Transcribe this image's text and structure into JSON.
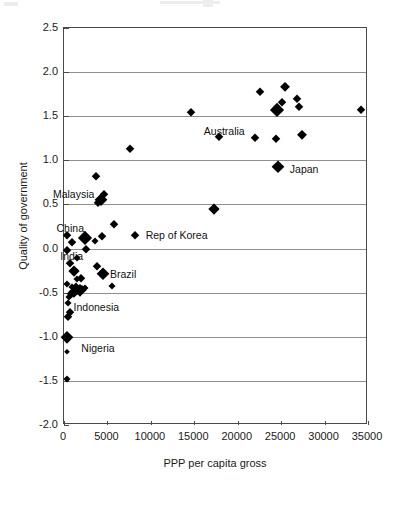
{
  "chart_data": {
    "type": "scatter",
    "title": "",
    "xlabel": "PPP per capita gross",
    "ylabel": "Quality of government",
    "xlim": [
      0,
      35000
    ],
    "ylim": [
      -2.0,
      2.5
    ],
    "xticks": [
      0,
      5000,
      10000,
      15000,
      20000,
      25000,
      30000,
      35000
    ],
    "xtick_labels": [
      "0",
      "5000",
      "10000",
      "15000",
      "20000",
      "25000",
      "30000",
      "35000"
    ],
    "yticks": [
      -2.0,
      -1.5,
      -1.0,
      -0.5,
      0.0,
      0.5,
      1.0,
      1.5,
      2.0,
      2.5
    ],
    "ytick_labels": [
      "-2.0",
      "-1.5",
      "-1.0",
      "-0.5",
      "0.0",
      "0.5",
      "1.0",
      "1.5",
      "2.0",
      "2.5"
    ],
    "grid": "horizontal",
    "legend": "none",
    "marker": "diamond",
    "marker_color": "#000000",
    "note": "Marker size varies with population/weight; larger diamonds denote larger countries.",
    "points": [
      {
        "x": 300,
        "y": -1.48,
        "size": 7
      },
      {
        "x": 350,
        "y": -1.17,
        "size": 6
      },
      {
        "x": 400,
        "y": -1.0,
        "size": 12,
        "label": "Nigeria"
      },
      {
        "x": 500,
        "y": -0.78,
        "size": 9
      },
      {
        "x": 700,
        "y": -0.72,
        "size": 8
      },
      {
        "x": 450,
        "y": -0.62,
        "size": 7
      },
      {
        "x": 600,
        "y": -0.55,
        "size": 7
      },
      {
        "x": 800,
        "y": -0.52,
        "size": 9
      },
      {
        "x": 1000,
        "y": -0.5,
        "size": 8
      },
      {
        "x": 1200,
        "y": -0.49,
        "size": 11
      },
      {
        "x": 1500,
        "y": -0.48,
        "size": 9
      },
      {
        "x": 1800,
        "y": -0.47,
        "size": 12
      },
      {
        "x": 2100,
        "y": -0.46,
        "size": 8
      },
      {
        "x": 2400,
        "y": -0.45,
        "size": 7
      },
      {
        "x": 900,
        "y": -0.44,
        "size": 7
      },
      {
        "x": 1400,
        "y": -0.43,
        "size": 7
      },
      {
        "x": 5500,
        "y": -0.43,
        "size": 7
      },
      {
        "x": 400,
        "y": -0.4,
        "size": 7
      },
      {
        "x": 1500,
        "y": -0.35,
        "size": 7
      },
      {
        "x": 1900,
        "y": -0.33,
        "size": 8
      },
      {
        "x": 4500,
        "y": -0.29,
        "size": 13,
        "label": "Brazil"
      },
      {
        "x": 1200,
        "y": -0.25,
        "size": 11
      },
      {
        "x": 3800,
        "y": -0.2,
        "size": 8
      },
      {
        "x": 700,
        "y": -0.16,
        "size": 8
      },
      {
        "x": 1500,
        "y": -0.11,
        "size": 7
      },
      {
        "x": 300,
        "y": -0.02,
        "size": 8
      },
      {
        "x": 2500,
        "y": 0.0,
        "size": 8,
        "label": "India"
      },
      {
        "x": 900,
        "y": 0.07,
        "size": 8
      },
      {
        "x": 3600,
        "y": 0.09,
        "size": 7
      },
      {
        "x": 2400,
        "y": 0.12,
        "size": 14,
        "label": "China"
      },
      {
        "x": 400,
        "y": 0.15,
        "size": 8
      },
      {
        "x": 4400,
        "y": 0.14,
        "size": 8
      },
      {
        "x": 8200,
        "y": 0.15,
        "size": 8,
        "label": "Rep of Korea"
      },
      {
        "x": 5800,
        "y": 0.28,
        "size": 8
      },
      {
        "x": 17300,
        "y": 0.45,
        "size": 11
      },
      {
        "x": 3900,
        "y": 0.52,
        "size": 9
      },
      {
        "x": 4300,
        "y": 0.55,
        "size": 13,
        "label": "Malaysia"
      },
      {
        "x": 4600,
        "y": 0.62,
        "size": 8
      },
      {
        "x": 3700,
        "y": 0.82,
        "size": 8
      },
      {
        "x": 24600,
        "y": 0.92,
        "size": 13,
        "label": "Japan"
      },
      {
        "x": 7600,
        "y": 1.13,
        "size": 9
      },
      {
        "x": 22000,
        "y": 1.25,
        "size": 9,
        "label": "Australia"
      },
      {
        "x": 24400,
        "y": 1.24,
        "size": 9
      },
      {
        "x": 27400,
        "y": 1.29,
        "size": 10
      },
      {
        "x": 17800,
        "y": 1.27,
        "size": 9
      },
      {
        "x": 14600,
        "y": 1.55,
        "size": 8
      },
      {
        "x": 24500,
        "y": 1.57,
        "size": 14
      },
      {
        "x": 27000,
        "y": 1.6,
        "size": 9
      },
      {
        "x": 34200,
        "y": 1.57,
        "size": 9
      },
      {
        "x": 25100,
        "y": 1.66,
        "size": 8
      },
      {
        "x": 26800,
        "y": 1.7,
        "size": 9
      },
      {
        "x": 22600,
        "y": 1.77,
        "size": 9
      },
      {
        "x": 25400,
        "y": 1.83,
        "size": 10
      }
    ],
    "annotations": [
      {
        "text": "Australia",
        "x": 20800,
        "y": 1.33,
        "anchor": "end"
      },
      {
        "text": "Japan",
        "x": 26000,
        "y": 0.9,
        "anchor": "start"
      },
      {
        "text": "Malaysia",
        "x": 3500,
        "y": 0.62,
        "anchor": "end"
      },
      {
        "text": "China",
        "x": 2300,
        "y": 0.23,
        "anchor": "end"
      },
      {
        "text": "Rep of Korea",
        "x": 9400,
        "y": 0.15,
        "anchor": "start"
      },
      {
        "text": "India",
        "x": 2200,
        "y": -0.09,
        "anchor": "end"
      },
      {
        "text": "Brazil",
        "x": 5300,
        "y": -0.29,
        "anchor": "start"
      },
      {
        "text": "Indonesia",
        "x": 1100,
        "y": -0.66,
        "anchor": "start"
      },
      {
        "text": "Nigeria",
        "x": 2000,
        "y": -1.13,
        "anchor": "start"
      }
    ]
  }
}
